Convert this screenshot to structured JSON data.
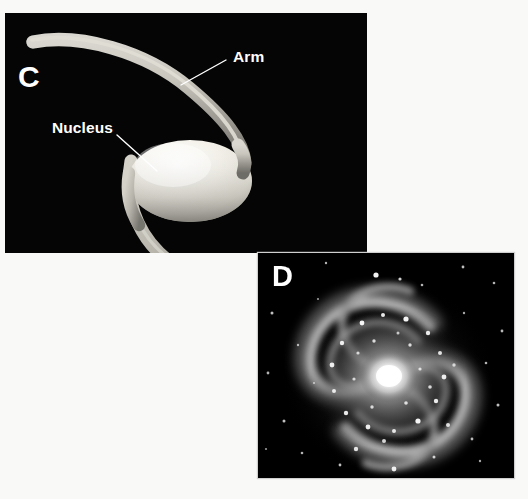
{
  "figure": {
    "background_color": "#f9f9f7",
    "panels": [
      {
        "id": "C",
        "letter": "C",
        "type": "illustration",
        "subject": "barred/spiral galaxy schematic",
        "background_color": "#050505",
        "labels": [
          {
            "name": "arm-top",
            "text": "Arm",
            "leader": true
          },
          {
            "name": "nucleus",
            "text": "Nucleus",
            "leader": true
          },
          {
            "name": "arm-bottom",
            "text": "Arm",
            "leader": true
          }
        ],
        "elements": {
          "nucleus_color": "#eceae2",
          "arm_color": "#b9b7ae",
          "leader_line_color": "#ffffff"
        }
      },
      {
        "id": "D",
        "letter": "D",
        "type": "photograph",
        "subject": "spiral galaxy",
        "background_color": "#000000",
        "labels": [],
        "elements": {
          "core_color": "#ffffff",
          "halo_color": "#b8b8b8",
          "star_color": "#ffffff"
        }
      }
    ]
  },
  "panel_c": {
    "letter": "C",
    "arm_top_label": "Arm",
    "nucleus_label": "Nucleus",
    "arm_bottom_label": "Arm"
  },
  "panel_d": {
    "letter": "D"
  }
}
